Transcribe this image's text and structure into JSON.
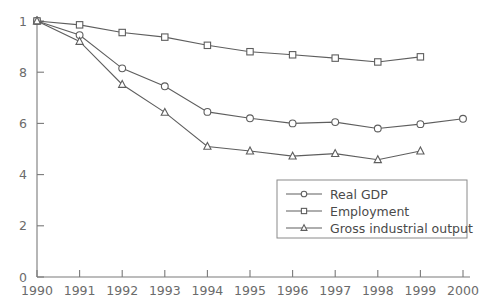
{
  "chart_data": {
    "type": "line",
    "title": "",
    "xlabel": "",
    "ylabel": "",
    "x": [
      1990,
      1991,
      1992,
      1993,
      1994,
      1995,
      1996,
      1997,
      1998,
      1999,
      2000
    ],
    "xtick_labels": [
      "1990",
      "1991",
      "1992",
      "1993",
      "1994",
      "1995",
      "1996",
      "1997",
      "1998",
      "1999",
      "2000"
    ],
    "ytick_labels": [
      "0",
      "2",
      "4",
      "6",
      "8",
      "1"
    ],
    "ytick_values": [
      0,
      0.2,
      0.4,
      0.6,
      0.8,
      1.0
    ],
    "xlim": [
      1990,
      2000
    ],
    "ylim": [
      0,
      1.0
    ],
    "grid": false,
    "legend_position": "lower right",
    "series": [
      {
        "name": "Real GDP",
        "marker": "circle",
        "color": "#5e5e5e",
        "x": [
          1990,
          1991,
          1992,
          1993,
          1994,
          1995,
          1996,
          1997,
          1998,
          1999,
          2000
        ],
        "values": [
          1.0,
          0.945,
          0.815,
          0.745,
          0.645,
          0.62,
          0.6,
          0.605,
          0.58,
          0.597,
          0.618
        ]
      },
      {
        "name": "Employment",
        "marker": "square",
        "color": "#5e5e5e",
        "x": [
          1990,
          1991,
          1992,
          1993,
          1994,
          1995,
          1996,
          1997,
          1998,
          1999
        ],
        "values": [
          1.0,
          0.985,
          0.955,
          0.937,
          0.905,
          0.88,
          0.868,
          0.855,
          0.84,
          0.86
        ]
      },
      {
        "name": "Gross industrial output",
        "marker": "triangle",
        "color": "#5e5e5e",
        "x": [
          1990,
          1991,
          1992,
          1993,
          1994,
          1995,
          1996,
          1997,
          1998,
          1999
        ],
        "values": [
          1.0,
          0.92,
          0.752,
          0.643,
          0.51,
          0.492,
          0.472,
          0.482,
          0.458,
          0.492
        ]
      }
    ]
  },
  "legend": {
    "items": [
      {
        "label": "Real GDP"
      },
      {
        "label": "Employment"
      },
      {
        "label": "Gross industrial output"
      }
    ]
  }
}
